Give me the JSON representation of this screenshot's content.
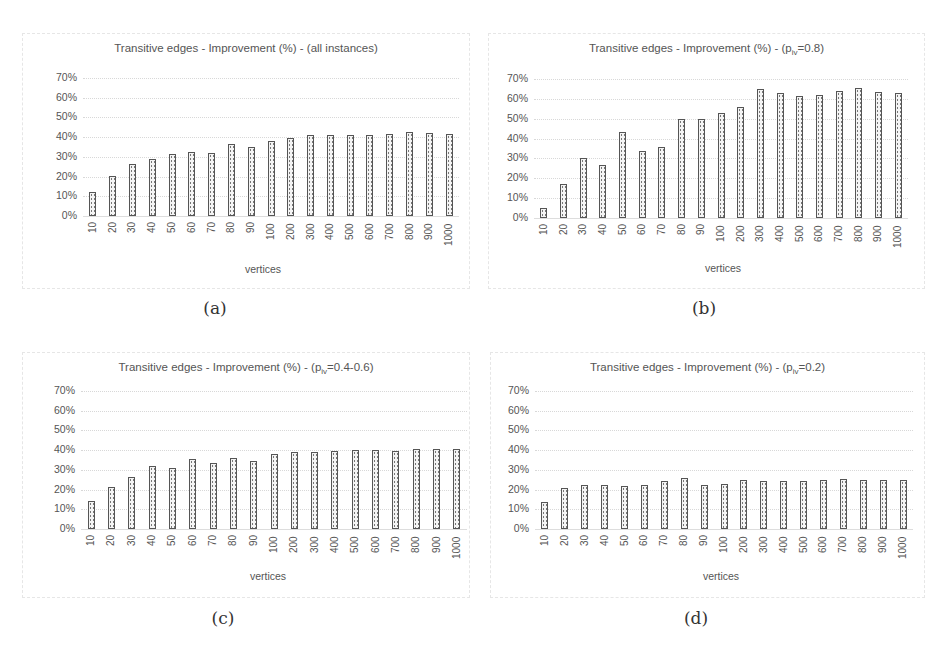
{
  "figure": {
    "panels": [
      {
        "id": "a",
        "caption": "(a)",
        "title_main": "Transitive edges - Improvement (%) - (all instances)",
        "title_sub": "",
        "title_tail": ""
      },
      {
        "id": "b",
        "caption": "(b)",
        "title_main": "Transitive edges - Improvement (%) - (p",
        "title_sub": "iv",
        "title_tail": "=0.8)"
      },
      {
        "id": "c",
        "caption": "(c)",
        "title_main": "Transitive edges - Improvement (%) - (p",
        "title_sub": "iv",
        "title_tail": "=0.4-0.6)"
      },
      {
        "id": "d",
        "caption": "(d)",
        "title_main": "Transitive edges - Improvement (%) - (p",
        "title_sub": "iv",
        "title_tail": "=0.2)"
      }
    ]
  },
  "chart_data": [
    {
      "type": "bar",
      "title": "Transitive edges - Improvement (%) - (all instances)",
      "xlabel": "vertices",
      "ylabel": "",
      "categories": [
        "10",
        "20",
        "30",
        "40",
        "50",
        "60",
        "70",
        "80",
        "90",
        "100",
        "200",
        "300",
        "400",
        "500",
        "600",
        "700",
        "800",
        "900",
        "1000"
      ],
      "values": [
        12,
        20.5,
        26.5,
        29,
        31.5,
        32.5,
        32,
        36.5,
        35,
        38,
        39.5,
        41,
        41,
        41,
        41,
        41.5,
        42.5,
        42,
        41.5
      ],
      "yticks": [
        "0%",
        "10%",
        "20%",
        "30%",
        "40%",
        "50%",
        "60%",
        "70%"
      ],
      "ylim": [
        0,
        70
      ],
      "grid": true,
      "legend": "none"
    },
    {
      "type": "bar",
      "title": "Transitive edges - Improvement (%) - (p_iv=0.8)",
      "xlabel": "vertices",
      "ylabel": "",
      "categories": [
        "10",
        "20",
        "30",
        "40",
        "50",
        "60",
        "70",
        "80",
        "90",
        "100",
        "200",
        "300",
        "400",
        "500",
        "600",
        "700",
        "800",
        "900",
        "1000"
      ],
      "values": [
        5,
        17,
        30,
        26.5,
        43.5,
        34,
        36,
        50,
        50,
        53,
        56,
        65,
        63,
        61.5,
        62,
        64,
        65.5,
        63.5,
        63
      ],
      "yticks": [
        "0%",
        "10%",
        "20%",
        "30%",
        "40%",
        "50%",
        "60%",
        "70%"
      ],
      "ylim": [
        0,
        70
      ],
      "grid": true,
      "legend": "none"
    },
    {
      "type": "bar",
      "title": "Transitive edges - Improvement (%) - (p_iv=0.4-0.6)",
      "xlabel": "vertices",
      "ylabel": "",
      "categories": [
        "10",
        "20",
        "30",
        "40",
        "50",
        "60",
        "70",
        "80",
        "90",
        "100",
        "200",
        "300",
        "400",
        "500",
        "600",
        "700",
        "800",
        "900",
        "1000"
      ],
      "values": [
        14,
        21.5,
        26.5,
        32,
        31,
        35.5,
        33.5,
        36,
        34.5,
        38,
        39,
        39,
        39.5,
        40,
        40,
        39.5,
        40.5,
        40.5,
        40.5
      ],
      "yticks": [
        "0%",
        "10%",
        "20%",
        "30%",
        "40%",
        "50%",
        "60%",
        "70%"
      ],
      "ylim": [
        0,
        70
      ],
      "grid": true,
      "legend": "none"
    },
    {
      "type": "bar",
      "title": "Transitive edges - Improvement (%) - (p_iv=0.2)",
      "xlabel": "vertices",
      "ylabel": "",
      "categories": [
        "10",
        "20",
        "30",
        "40",
        "50",
        "60",
        "70",
        "80",
        "90",
        "100",
        "200",
        "300",
        "400",
        "500",
        "600",
        "700",
        "800",
        "900",
        "1000"
      ],
      "values": [
        13.5,
        21,
        22.5,
        22.5,
        22,
        22.5,
        24.5,
        26,
        22.5,
        23,
        25,
        24.5,
        24.5,
        24.5,
        25,
        25.5,
        25,
        25,
        25
      ],
      "yticks": [
        "0%",
        "10%",
        "20%",
        "30%",
        "40%",
        "50%",
        "60%",
        "70%"
      ],
      "ylim": [
        0,
        70
      ],
      "grid": true,
      "legend": "none"
    }
  ]
}
